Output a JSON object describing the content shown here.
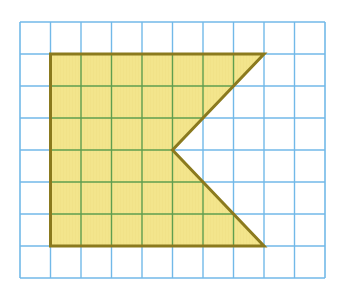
{
  "figure": {
    "canvas": {
      "width": 338,
      "height": 296
    },
    "background_color": "#ffffff"
  },
  "grid": {
    "name": "square-grid",
    "columns": 10,
    "rows": 8,
    "origin_x": 20,
    "origin_y": 22,
    "cell_width": 30.5,
    "cell_height": 32,
    "line_color": "#72B9E8",
    "line_color_over_fill": "#5F9E4F",
    "line_width": 1.4,
    "border_color": "#72B9E8",
    "border_width": 1.6,
    "total_width": 305,
    "total_height": 256
  },
  "shape": {
    "name": "concave-pentagon",
    "fill_color": "#F3E58C",
    "stroke_color": "#8B7A1E",
    "stroke_width": 3,
    "vertex_count": 5,
    "grid_vertices": [
      {
        "label": "top-left",
        "col": 1,
        "row": 1
      },
      {
        "label": "top-right",
        "col": 8,
        "row": 1
      },
      {
        "label": "notch-point",
        "col": 5,
        "row": 4
      },
      {
        "label": "bottom-right",
        "col": 8,
        "row": 7
      },
      {
        "label": "bottom-left",
        "col": 1,
        "row": 7
      }
    ],
    "pixel_vertices": [
      {
        "label": "top-left",
        "x": 50.5,
        "y": 54
      },
      {
        "label": "top-right",
        "x": 264,
        "y": 54
      },
      {
        "label": "notch-point",
        "x": 172.5,
        "y": 150
      },
      {
        "label": "bottom-right",
        "x": 264,
        "y": 246
      },
      {
        "label": "bottom-left",
        "x": 50.5,
        "y": 246
      }
    ],
    "points_attr": "50.5,54 264,54 172.5,150 264,246 50.5,246"
  }
}
